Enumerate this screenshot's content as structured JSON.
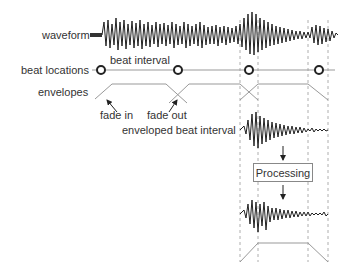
{
  "labels": {
    "waveform": "waveform",
    "beat_locations": "beat locations",
    "beat_interval": "beat interval",
    "envelopes": "envelopes",
    "fade_in": "fade in",
    "fade_out": "fade out",
    "enveloped_beat_interval": "enveloped beat interval",
    "processing": "Processing"
  },
  "beat_markers": [
    101,
    178,
    249,
    319
  ],
  "colors": {
    "waveform": "#222222",
    "lines": "#999999",
    "text": "#333333"
  }
}
